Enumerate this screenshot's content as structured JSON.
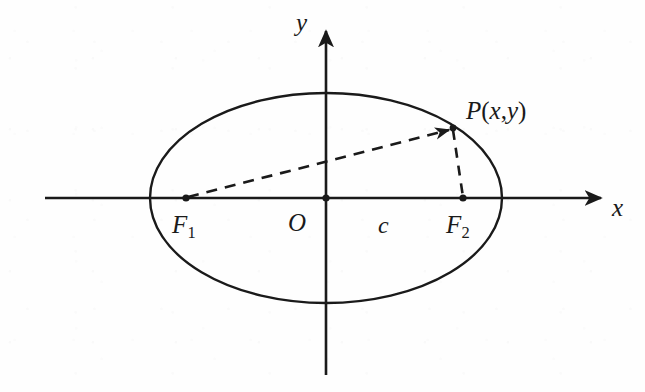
{
  "figure": {
    "kind": "geometry-diagram",
    "width": 645,
    "height": 392,
    "ink_color": "#1a1a1a",
    "background_color": "#fefefe"
  },
  "axes": {
    "x_label": "x",
    "y_label": "y",
    "origin_label": "O",
    "x_axis": {
      "from_x": 45,
      "to_x": 605,
      "y": 198,
      "arrow": "right"
    },
    "y_axis": {
      "from_y": 375,
      "to_y": 27,
      "x": 326,
      "arrow": "up"
    }
  },
  "ellipse": {
    "center_x": 326,
    "center_y": 198,
    "semi_major_a": 176,
    "semi_minor_b": 105
  },
  "points": {
    "origin": {
      "label": "O",
      "x": 326,
      "y": 198
    },
    "focus_left": {
      "label_base": "F",
      "label_sub": "1",
      "x": 186,
      "y": 198
    },
    "focus_right": {
      "label_base": "F",
      "label_sub": "2",
      "x": 463,
      "y": 198
    },
    "moving_point": {
      "label_base": "P",
      "label_open": "(",
      "label_x": "x",
      "label_comma": ",",
      "label_y": "y",
      "label_close": ")",
      "x": 453,
      "y": 128
    }
  },
  "segments": {
    "focal_radius_left": {
      "name": "F1-to-P",
      "style": "dashed",
      "from_x": 186,
      "from_y": 198,
      "to_x": 453,
      "to_y": 128,
      "arrow_at_end": true
    },
    "focal_radius_right": {
      "name": "P-to-F2",
      "style": "dashed",
      "from_x": 453,
      "from_y": 128,
      "to_x": 463,
      "to_y": 198,
      "arrow_at_end": false
    }
  },
  "annotations": {
    "semi_focal_distance": {
      "label": "c",
      "x": 385,
      "y": 228
    }
  }
}
